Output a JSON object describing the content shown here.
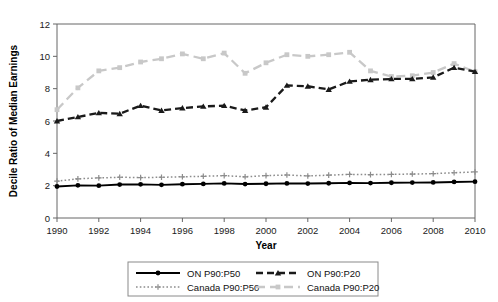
{
  "chart_data": {
    "type": "line",
    "title": "",
    "xlabel": "Year",
    "ylabel": "Decile Ratio of Median Earnings",
    "xlim": [
      1990,
      2010
    ],
    "ylim": [
      0,
      12
    ],
    "yticks": [
      0,
      2,
      4,
      6,
      8,
      10,
      12
    ],
    "xticks": [
      1990,
      1992,
      1994,
      1996,
      1998,
      2000,
      2002,
      2004,
      2006,
      2008,
      2010
    ],
    "xtick_labels": [
      "1990",
      "1992",
      "1994",
      "1996",
      "1998",
      "2000",
      "2002",
      "2004",
      "2006",
      "2008",
      "2010"
    ],
    "ytick_labels": [
      "0",
      "2",
      "4",
      "6",
      "8",
      "10",
      "12"
    ],
    "grid": false,
    "legend_position": "bottom",
    "x": [
      1990,
      1991,
      1992,
      1993,
      1994,
      1995,
      1996,
      1997,
      1998,
      1999,
      2000,
      2001,
      2002,
      2003,
      2004,
      2005,
      2006,
      2007,
      2008,
      2009,
      2010
    ],
    "series": [
      {
        "name": "ON P90:P50",
        "color": "#000000",
        "style": "solid",
        "marker": "circle",
        "values": [
          1.95,
          2.02,
          2.0,
          2.07,
          2.08,
          2.05,
          2.09,
          2.11,
          2.14,
          2.1,
          2.12,
          2.14,
          2.13,
          2.15,
          2.17,
          2.16,
          2.18,
          2.19,
          2.2,
          2.23,
          2.25
        ]
      },
      {
        "name": "ON P90:P20",
        "color": "#1a1a1a",
        "style": "dashed",
        "marker": "triangle",
        "values": [
          6.0,
          6.25,
          6.5,
          6.45,
          6.95,
          6.65,
          6.8,
          6.9,
          6.95,
          6.65,
          6.85,
          8.2,
          8.15,
          7.95,
          8.45,
          8.55,
          8.6,
          8.6,
          8.7,
          9.3,
          9.05
        ]
      },
      {
        "name": "Canada P90:P50",
        "color": "#8c8c8c",
        "style": "dotted",
        "marker": "plus",
        "values": [
          2.28,
          2.42,
          2.48,
          2.52,
          2.5,
          2.52,
          2.55,
          2.58,
          2.62,
          2.55,
          2.62,
          2.66,
          2.6,
          2.65,
          2.7,
          2.68,
          2.7,
          2.72,
          2.74,
          2.8,
          2.85
        ]
      },
      {
        "name": "Canada P90:P20",
        "color": "#c8c8c8",
        "style": "dash-long",
        "marker": "square",
        "values": [
          6.7,
          8.05,
          9.1,
          9.3,
          9.65,
          9.85,
          10.15,
          9.85,
          10.2,
          8.95,
          9.6,
          10.1,
          10.0,
          10.1,
          10.25,
          9.1,
          8.75,
          8.8,
          9.0,
          9.55,
          9.05
        ]
      }
    ]
  },
  "legend": {
    "items": [
      {
        "label": "ON P90:P50",
        "key": "on-p90-p50"
      },
      {
        "label": "ON P90:P20",
        "key": "on-p90-p20"
      },
      {
        "label": "Canada P90:P50",
        "key": "canada-p90-p50"
      },
      {
        "label": "Canada P90:P20",
        "key": "canada-p90-p20"
      }
    ]
  }
}
